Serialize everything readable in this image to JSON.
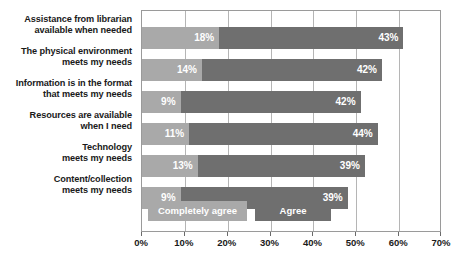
{
  "chart_data": {
    "type": "bar",
    "orientation": "horizontal",
    "stacked": true,
    "title": "",
    "xlabel": "",
    "ylabel": "",
    "xlim": [
      0,
      70
    ],
    "grid": true,
    "legend_position": "inside-bottom-left",
    "categories": [
      "Assistance from librarian\navailable when needed",
      "The physical environment\nmeets my needs",
      "Information is in the format\nthat meets my needs",
      "Resources are available\nwhen I need",
      "Technology\nmeets my needs",
      "Content/collection\nmeets my needs"
    ],
    "category_lines": [
      [
        "Assistance from librarian",
        "available when needed"
      ],
      [
        "The physical environment",
        "meets my needs"
      ],
      [
        "Information is in the format",
        "that meets my needs"
      ],
      [
        "Resources are available",
        "when I need"
      ],
      [
        "Technology",
        "meets my needs"
      ],
      [
        "Content/collection",
        "meets my needs"
      ]
    ],
    "series": [
      {
        "name": "Completely agree",
        "color": "#a9a9a9",
        "values": [
          18,
          14,
          9,
          11,
          13,
          9
        ],
        "labels": [
          "18%",
          "14%",
          "9%",
          "11%",
          "13%",
          "9%"
        ]
      },
      {
        "name": "Agree",
        "color": "#6f6f6f",
        "values": [
          43,
          42,
          42,
          44,
          39,
          39
        ],
        "labels": [
          "43%",
          "42%",
          "42%",
          "44%",
          "39%",
          "39%"
        ]
      }
    ],
    "totals": [
      61,
      56,
      51,
      55,
      52,
      48
    ],
    "xticks": [
      0,
      10,
      20,
      30,
      40,
      50,
      60,
      70
    ],
    "xtick_labels": [
      "0%",
      "10%",
      "20%",
      "30%",
      "40%",
      "50%",
      "60%",
      "70%"
    ]
  },
  "legend": {
    "items": [
      {
        "label": "Completely agree",
        "color": "#a9a9a9"
      },
      {
        "label": "Agree",
        "color": "#6f6f6f"
      }
    ]
  },
  "colors": {
    "series_light": "#a9a9a9",
    "series_dark": "#6f6f6f",
    "grid": "#b5b5b5",
    "border": "#9a9a9a",
    "text": "#1a1a1a",
    "value_text": "#ffffff",
    "background": "#ffffff"
  }
}
